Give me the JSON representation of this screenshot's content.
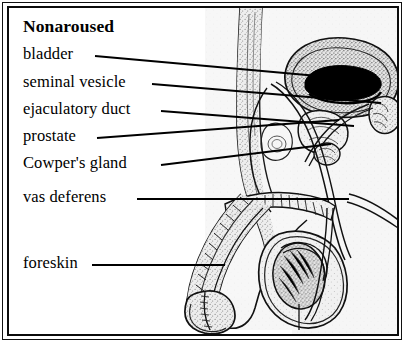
{
  "figure": {
    "title": "Nonaroused",
    "frame_color": "#0b0b0b",
    "background_color": "#ffffff",
    "tissue_fill": "#e8e8e8",
    "organ_dark_fill": "#000000"
  },
  "labels": [
    {
      "id": "title",
      "text": "Nonaroused",
      "x": 14,
      "y": 14,
      "leader": false
    },
    {
      "id": "bladder",
      "text": "bladder",
      "x": 14,
      "y": 40,
      "leader": true,
      "line": {
        "x1": 86,
        "y1": 48,
        "x2": 320,
        "y2": 69
      }
    },
    {
      "id": "seminal-vesicle",
      "text": "seminal vesicle",
      "x": 14,
      "y": 68,
      "leader": true,
      "line": {
        "x1": 143,
        "y1": 76,
        "x2": 372,
        "y2": 95
      }
    },
    {
      "id": "ejaculatory-duct",
      "text": "ejaculatory duct",
      "x": 14,
      "y": 95,
      "leader": true,
      "line": {
        "x1": 152,
        "y1": 103,
        "x2": 345,
        "y2": 118
      }
    },
    {
      "id": "prostate",
      "text": "prostate",
      "x": 14,
      "y": 122,
      "leader": true,
      "line": {
        "x1": 88,
        "y1": 130,
        "x2": 330,
        "y2": 112
      }
    },
    {
      "id": "cowpers-gland",
      "text": "Cowper's gland",
      "x": 14,
      "y": 149,
      "leader": true,
      "line": {
        "x1": 152,
        "y1": 157,
        "x2": 322,
        "y2": 136
      }
    },
    {
      "id": "vas-deferens",
      "text": "vas deferens",
      "x": 14,
      "y": 183,
      "leader": true,
      "line": {
        "x1": 128,
        "y1": 191,
        "x2": 340,
        "y2": 191
      }
    },
    {
      "id": "foreskin",
      "text": "foreskin",
      "x": 14,
      "y": 249,
      "leader": true,
      "line": {
        "x1": 83,
        "y1": 257,
        "x2": 216,
        "y2": 257
      }
    }
  ],
  "anatomy_parts": [
    "abdominal-wall",
    "bladder",
    "seminal-vesicle",
    "ejaculatory-duct",
    "prostate",
    "cowpers-gland",
    "vas-deferens",
    "urethra",
    "penis-shaft",
    "glans",
    "foreskin",
    "scrotum",
    "testis",
    "epididymis",
    "rectum",
    "pubic-bone"
  ]
}
